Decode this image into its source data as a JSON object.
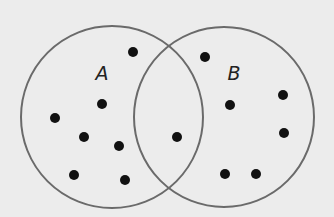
{
  "diagram": {
    "type": "venn",
    "background": "#ececec",
    "stroke_color": "#6a6a6a",
    "dot_color": "#111111",
    "sets": [
      {
        "label": "A",
        "cx": 112,
        "cy": 117,
        "r": 91,
        "label_x": 102,
        "label_y": 80
      },
      {
        "label": "B",
        "cx": 224,
        "cy": 117,
        "r": 90,
        "label_x": 234,
        "label_y": 80
      }
    ],
    "points": {
      "A_only": [
        [
          133,
          52
        ],
        [
          102,
          104
        ],
        [
          55,
          118
        ],
        [
          84,
          137
        ],
        [
          119,
          146
        ],
        [
          74,
          175
        ],
        [
          125,
          180
        ]
      ],
      "A_and_B": [
        [
          177,
          137
        ]
      ],
      "B_only": [
        [
          205,
          57
        ],
        [
          230,
          105
        ],
        [
          283,
          95
        ],
        [
          284,
          133
        ],
        [
          225,
          174
        ],
        [
          256,
          174
        ]
      ]
    },
    "counts": {
      "A_only": 7,
      "A_and_B": 1,
      "B_only": 6
    }
  }
}
